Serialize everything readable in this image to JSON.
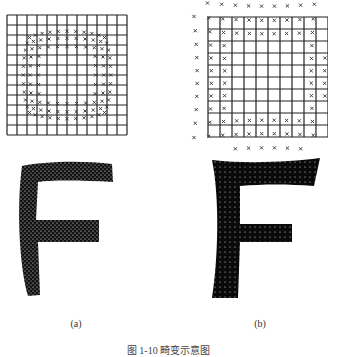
{
  "figure": {
    "panels": [
      {
        "label": "(a)",
        "grid": {
          "rows": 12,
          "cols": 12,
          "marker": "x",
          "description": "grid with pincushion-distorted point markers"
        },
        "letter": "F"
      },
      {
        "label": "(b)",
        "grid": {
          "rows": 10,
          "cols": 10,
          "marker": "x",
          "description": "grid with barrel-distorted point markers outside"
        },
        "letter": "F"
      }
    ],
    "caption": "图 1-10  畸变示意图"
  }
}
